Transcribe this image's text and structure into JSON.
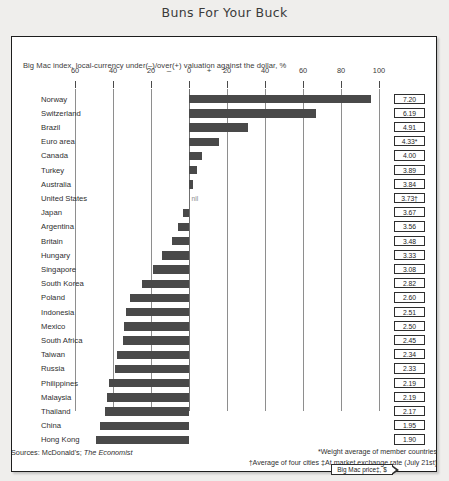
{
  "title": "Buns For Your Buck",
  "subtitle": "Big Mac index, local-currency under(–)/over(+) valuation against the dollar, %",
  "sources_prefix": "Sources: McDonald's; ",
  "sources_italic": "The Economist",
  "footnote_line1": "*Weight average of member countries",
  "footnote_line2": "†Average of four cities ‡At market exchange rate (July 21st)",
  "callout_label": "Big Mac price‡, $",
  "nil_label": "nil",
  "colors": {
    "bar": "#494949",
    "panel_bg": "#ffffff",
    "page_bg": "#efeeec",
    "grid": "#8e8e8e",
    "text": "#2f2f2f"
  },
  "chart_data": {
    "type": "bar",
    "orientation": "horizontal",
    "title": "Buns For Your Buck",
    "subtitle": "Big Mac index, local-currency under(–)/over(+) valuation against the dollar, %",
    "xlabel": "",
    "ylabel": "",
    "xlim": [
      -60,
      100
    ],
    "xticks": [
      -60,
      -40,
      -20,
      0,
      20,
      40,
      60,
      80,
      100
    ],
    "xticklabels": [
      "60",
      "40",
      "20",
      "0",
      "20",
      "40",
      "60",
      "80",
      "100"
    ],
    "sign_labels": {
      "minus": "–",
      "plus": "+"
    },
    "grid": true,
    "legend": "none",
    "value_column_header": "Big Mac price‡, $",
    "categories": [
      "Norway",
      "Switzerland",
      "Brazil",
      "Euro area",
      "Canada",
      "Turkey",
      "Australia",
      "United States",
      "Japan",
      "Argentina",
      "Britain",
      "Hungary",
      "Singapore",
      "South Korea",
      "Poland",
      "Indonesia",
      "Mexico",
      "South Africa",
      "Taiwan",
      "Russia",
      "Philippines",
      "Malaysia",
      "Thailand",
      "China",
      "Hong Kong"
    ],
    "values": [
      96,
      67,
      31,
      16,
      7,
      4,
      2,
      0,
      -3,
      -6,
      -9,
      -14,
      -19,
      -25,
      -31,
      -33,
      -34,
      -35,
      -38,
      -39,
      -42,
      -43,
      -44,
      -47,
      -49
    ],
    "price_labels": [
      "7.20",
      "6.19",
      "4.91",
      "4.33*",
      "4.00",
      "3.89",
      "3.84",
      "3.73†",
      "3.67",
      "3.56",
      "3.48",
      "3.33",
      "3.08",
      "2.82",
      "2.60",
      "2.51",
      "2.50",
      "2.45",
      "2.34",
      "2.33",
      "2.19",
      "2.19",
      "2.17",
      "1.95",
      "1.90"
    ],
    "prices_numeric": [
      7.2,
      6.19,
      4.91,
      4.33,
      4.0,
      3.89,
      3.84,
      3.73,
      3.67,
      3.56,
      3.48,
      3.33,
      3.08,
      2.82,
      2.6,
      2.51,
      2.5,
      2.45,
      2.34,
      2.33,
      2.19,
      2.19,
      2.17,
      1.95,
      1.9
    ],
    "annotations": [
      {
        "category": "United States",
        "text": "nil"
      }
    ],
    "footnotes": [
      "*Weight average of member countries",
      "†Average of four cities ‡At market exchange rate (July 21st)"
    ],
    "sources": "Sources: McDonald's; The Economist"
  }
}
